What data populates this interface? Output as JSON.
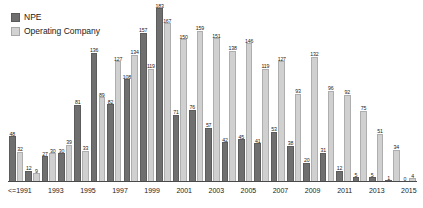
{
  "legend": {
    "position": "top-left",
    "items": [
      {
        "label": "NPE",
        "color": "#6f6f6f",
        "key": "npe"
      },
      {
        "label": "Operating Company",
        "color": "#d0d0d0",
        "key": "oc"
      }
    ]
  },
  "chart_data": {
    "type": "bar",
    "title": "",
    "subtitle": "",
    "xlabel": "",
    "ylabel": "",
    "grid": false,
    "legend_position": "top-left",
    "ylim": [
      0,
      183
    ],
    "categories": [
      "<=1991",
      "1992",
      "1993",
      "1994",
      "1995",
      "1996",
      "1997",
      "1998",
      "1999",
      "2000",
      "2001",
      "2002",
      "2003",
      "2004",
      "2005",
      "2006",
      "2007",
      "2008",
      "2009",
      "2010",
      "2011",
      "2012",
      "2013",
      "2014",
      "2015"
    ],
    "tick_labels": [
      "<=1991",
      "",
      "1993",
      "",
      "1995",
      "",
      "1997",
      "",
      "1999",
      "",
      "2001",
      "",
      "2003",
      "",
      "2005",
      "",
      "2007",
      "",
      "2009",
      "",
      "2011",
      "",
      "2013",
      "",
      "2015"
    ],
    "series": [
      {
        "name": "NPE",
        "color": "#6f6f6f",
        "values": [
          48,
          12,
          27,
          30,
          81,
          136,
          82,
          108,
          157,
          183,
          71,
          76,
          57,
          42,
          45,
          41,
          53,
          38,
          20,
          31,
          12,
          5,
          5,
          1,
          0
        ]
      },
      {
        "name": "Operating Company",
        "color": "#d0d0d0",
        "values": [
          32,
          9,
          30,
          39,
          33,
          89,
          127,
          134,
          119,
          167,
          150,
          159,
          151,
          138,
          146,
          119,
          127,
          93,
          132,
          96,
          92,
          75,
          51,
          34,
          4
        ]
      }
    ],
    "data_labels": true,
    "tail_zero_labels": [
      "0",
      "0"
    ]
  }
}
